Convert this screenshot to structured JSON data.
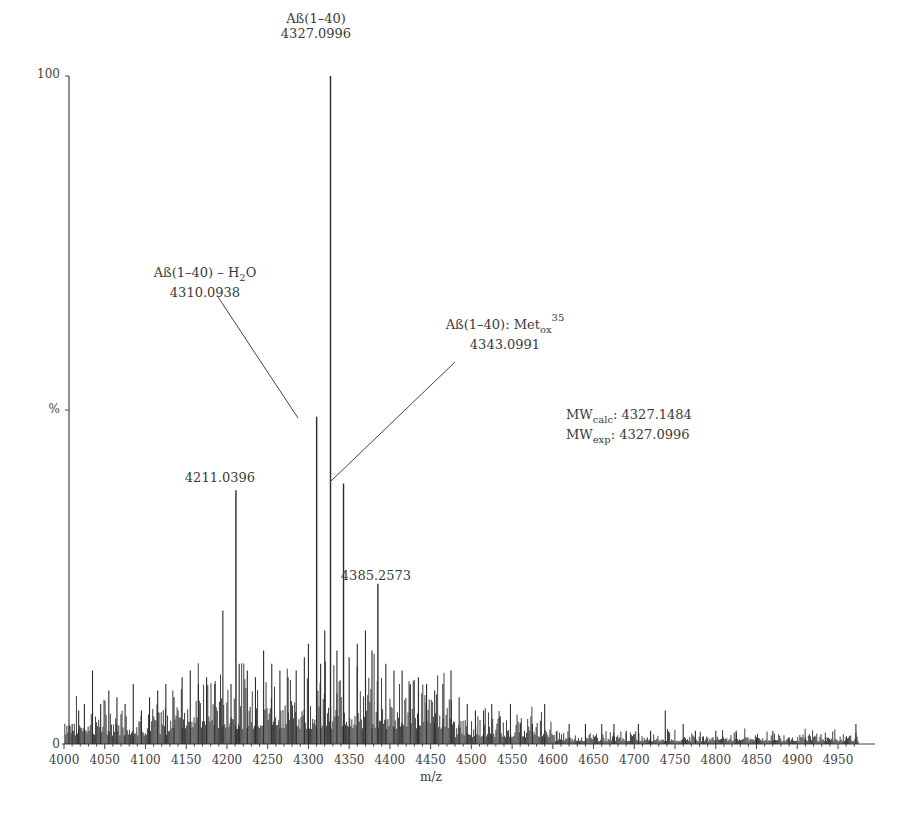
{
  "chart_data": {
    "type": "bar",
    "subtype": "mass-spectrum",
    "title": "",
    "xlabel": "m/z",
    "ylabel": "%",
    "xlim": [
      4000,
      4980
    ],
    "ylim": [
      0,
      100
    ],
    "x_ticks": [
      4000,
      4050,
      4100,
      4150,
      4200,
      4250,
      4300,
      4350,
      4400,
      4450,
      4500,
      4550,
      4600,
      4650,
      4700,
      4750,
      4800,
      4850,
      4900,
      4950
    ],
    "y_tick_labels": [
      {
        "value": 100,
        "label": "100"
      },
      {
        "value": 50,
        "label": "%"
      },
      {
        "value": 0,
        "label": "0"
      }
    ],
    "grid": false,
    "legend": null,
    "labeled_peaks": [
      {
        "mz": 4327.0996,
        "intensity": 100,
        "label_line1": "Aß(1–40)",
        "label_line2": "4327.0996"
      },
      {
        "mz": 4310.0938,
        "intensity": 49,
        "label_line1": "Aß(1–40) – H₂O",
        "label_line2": "4310.0938"
      },
      {
        "mz": 4343.0991,
        "intensity": 39,
        "label_line1": "Aß(1–40): Met_ox 35",
        "label_line2": "4343.0991"
      },
      {
        "mz": 4211.0396,
        "intensity": 38,
        "label_line1": "4211.0396",
        "label_line2": ""
      },
      {
        "mz": 4385.2573,
        "intensity": 24,
        "label_line1": "4385.2573",
        "label_line2": ""
      }
    ],
    "annotations": [
      {
        "text": "MW_calc: 4327.1484"
      },
      {
        "text": "MW_exp: 4327.0996"
      }
    ],
    "noise_peaks_approx": [
      {
        "mz": 4010,
        "i": 3
      },
      {
        "mz": 4018,
        "i": 5
      },
      {
        "mz": 4025,
        "i": 6
      },
      {
        "mz": 4035,
        "i": 11
      },
      {
        "mz": 4045,
        "i": 6
      },
      {
        "mz": 4055,
        "i": 8
      },
      {
        "mz": 4065,
        "i": 7
      },
      {
        "mz": 4075,
        "i": 6
      },
      {
        "mz": 4085,
        "i": 9
      },
      {
        "mz": 4095,
        "i": 5
      },
      {
        "mz": 4105,
        "i": 7
      },
      {
        "mz": 4115,
        "i": 8
      },
      {
        "mz": 4125,
        "i": 9
      },
      {
        "mz": 4135,
        "i": 7
      },
      {
        "mz": 4145,
        "i": 10
      },
      {
        "mz": 4155,
        "i": 11
      },
      {
        "mz": 4165,
        "i": 9
      },
      {
        "mz": 4175,
        "i": 10
      },
      {
        "mz": 4185,
        "i": 9
      },
      {
        "mz": 4195,
        "i": 20
      },
      {
        "mz": 4205,
        "i": 9
      },
      {
        "mz": 4215,
        "i": 12
      },
      {
        "mz": 4225,
        "i": 11
      },
      {
        "mz": 4235,
        "i": 10
      },
      {
        "mz": 4245,
        "i": 14
      },
      {
        "mz": 4255,
        "i": 12
      },
      {
        "mz": 4265,
        "i": 11
      },
      {
        "mz": 4275,
        "i": 10
      },
      {
        "mz": 4285,
        "i": 11
      },
      {
        "mz": 4295,
        "i": 13
      },
      {
        "mz": 4300,
        "i": 15
      },
      {
        "mz": 4315,
        "i": 12
      },
      {
        "mz": 4320,
        "i": 17
      },
      {
        "mz": 4335,
        "i": 14
      },
      {
        "mz": 4350,
        "i": 13
      },
      {
        "mz": 4360,
        "i": 15
      },
      {
        "mz": 4370,
        "i": 17
      },
      {
        "mz": 4378,
        "i": 14
      },
      {
        "mz": 4395,
        "i": 12
      },
      {
        "mz": 4405,
        "i": 11
      },
      {
        "mz": 4415,
        "i": 11
      },
      {
        "mz": 4425,
        "i": 9
      },
      {
        "mz": 4435,
        "i": 10
      },
      {
        "mz": 4445,
        "i": 9
      },
      {
        "mz": 4455,
        "i": 8
      },
      {
        "mz": 4465,
        "i": 9
      },
      {
        "mz": 4475,
        "i": 11
      },
      {
        "mz": 4485,
        "i": 7
      },
      {
        "mz": 4495,
        "i": 6
      },
      {
        "mz": 4505,
        "i": 5
      },
      {
        "mz": 4515,
        "i": 5
      },
      {
        "mz": 4525,
        "i": 6
      },
      {
        "mz": 4535,
        "i": 4
      },
      {
        "mz": 4548,
        "i": 6
      },
      {
        "mz": 4560,
        "i": 3
      },
      {
        "mz": 4575,
        "i": 3
      },
      {
        "mz": 4590,
        "i": 6
      },
      {
        "mz": 4605,
        "i": 2
      },
      {
        "mz": 4620,
        "i": 3
      },
      {
        "mz": 4640,
        "i": 3
      },
      {
        "mz": 4660,
        "i": 3
      },
      {
        "mz": 4675,
        "i": 3
      },
      {
        "mz": 4690,
        "i": 2
      },
      {
        "mz": 4705,
        "i": 3
      },
      {
        "mz": 4720,
        "i": 2
      },
      {
        "mz": 4738,
        "i": 5
      },
      {
        "mz": 4760,
        "i": 3
      },
      {
        "mz": 4775,
        "i": 2
      },
      {
        "mz": 4800,
        "i": 2
      },
      {
        "mz": 4825,
        "i": 2
      },
      {
        "mz": 4850,
        "i": 1
      },
      {
        "mz": 4870,
        "i": 2
      },
      {
        "mz": 4890,
        "i": 1
      },
      {
        "mz": 4910,
        "i": 1
      },
      {
        "mz": 4935,
        "i": 1
      },
      {
        "mz": 4960,
        "i": 1
      },
      {
        "mz": 4972,
        "i": 3
      }
    ]
  },
  "labels": {
    "peak_main_name": "Aß(1–40)",
    "peak_main_mz": "4327.0996",
    "peak_h2o_name_prefix": "Aß(1–40) – H",
    "peak_h2o_sub": "2",
    "peak_h2o_suffix": "O",
    "peak_h2o_mz": "4310.0938",
    "peak_met_name_prefix": "Aß(1–40): Met",
    "peak_met_sub": "ox",
    "peak_met_sup": "35",
    "peak_met_mz": "4343.0991",
    "peak_4211": "4211.0396",
    "peak_4385": "4385.2573",
    "mw_calc_prefix": "MW",
    "mw_calc_sub": "calc",
    "mw_calc_value": ": 4327.1484",
    "mw_exp_prefix": "MW",
    "mw_exp_sub": "exp",
    "mw_exp_value": ": 4327.0996",
    "y_top": "100",
    "y_mid": "%",
    "y_zero": "0",
    "x_axis_label": "m/z"
  },
  "colors": {
    "ink": "#3a3a3a",
    "peak": "#2a2a2a"
  }
}
